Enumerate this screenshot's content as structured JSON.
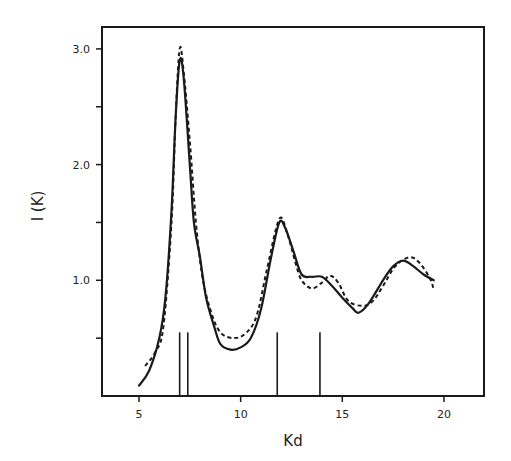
{
  "chart_data": {
    "type": "line",
    "title": "",
    "xlabel": "Kd",
    "ylabel": "I (K)",
    "xlim": [
      3.2,
      22
    ],
    "ylim": [
      0,
      3.2
    ],
    "x_ticks": [
      5,
      10,
      15,
      20
    ],
    "x_tick_labels": [
      "5",
      "10",
      "15",
      "20"
    ],
    "y_ticks": [
      0.5,
      1.0,
      1.5,
      2.0,
      2.5,
      3.0
    ],
    "y_tick_labels": [
      "",
      "1.0",
      "",
      "2.0",
      "",
      "3.0"
    ],
    "grid": false,
    "legend": null,
    "series": [
      {
        "name": "solid",
        "style": "solid",
        "x": [
          5.0,
          5.5,
          6.0,
          6.3,
          6.6,
          6.8,
          7.0,
          7.2,
          7.5,
          7.7,
          8.0,
          8.3,
          8.7,
          9.0,
          9.5,
          10.0,
          10.5,
          11.0,
          11.5,
          11.9,
          12.2,
          12.6,
          13.0,
          13.5,
          14.0,
          14.5,
          15.0,
          15.5,
          15.8,
          16.3,
          17.0,
          17.5,
          18.0,
          18.5,
          19.0,
          19.5
        ],
        "values": [
          0.09,
          0.22,
          0.5,
          0.85,
          1.6,
          2.4,
          2.9,
          2.75,
          2.0,
          1.5,
          1.2,
          0.85,
          0.6,
          0.45,
          0.4,
          0.42,
          0.5,
          0.75,
          1.2,
          1.5,
          1.45,
          1.25,
          1.05,
          1.03,
          1.03,
          0.95,
          0.85,
          0.76,
          0.72,
          0.8,
          1.0,
          1.12,
          1.17,
          1.12,
          1.05,
          1.0
        ]
      },
      {
        "name": "dashed",
        "style": "dashed",
        "x": [
          5.3,
          5.8,
          6.2,
          6.6,
          6.8,
          7.0,
          7.2,
          7.5,
          7.8,
          8.1,
          8.5,
          9.0,
          9.7,
          10.3,
          10.8,
          11.3,
          11.9,
          12.3,
          12.7,
          13.0,
          13.5,
          14.0,
          14.4,
          14.8,
          15.3,
          16.0,
          16.5,
          17.0,
          17.6,
          18.3,
          18.8,
          19.3,
          19.5
        ],
        "values": [
          0.26,
          0.38,
          0.6,
          1.5,
          2.4,
          3.0,
          2.8,
          2.2,
          1.5,
          1.05,
          0.75,
          0.55,
          0.5,
          0.55,
          0.7,
          1.1,
          1.53,
          1.4,
          1.15,
          1.0,
          0.93,
          0.98,
          1.04,
          0.98,
          0.82,
          0.78,
          0.82,
          0.95,
          1.12,
          1.2,
          1.15,
          1.02,
          0.92
        ]
      }
    ],
    "sticks": {
      "x": [
        7.0,
        7.4,
        11.8,
        13.9
      ],
      "height": 0.55
    }
  }
}
